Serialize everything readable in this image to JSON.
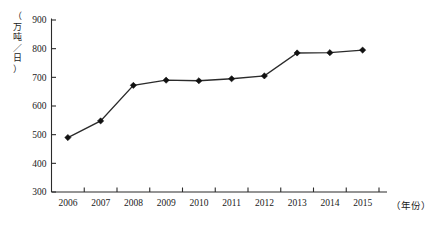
{
  "chart_data": {
    "type": "line",
    "title": "",
    "subtitle": "",
    "xlabel": "（年份）",
    "ylabel": "（万吨／日）",
    "categories": [
      "2006",
      "2007",
      "2008",
      "2009",
      "2010",
      "2011",
      "2012",
      "2013",
      "2014",
      "2015"
    ],
    "values": [
      490,
      548,
      672,
      690,
      688,
      695,
      705,
      785,
      786,
      795
    ],
    "series": [
      {
        "name": "日均处理量",
        "values": [
          490,
          548,
          672,
          690,
          688,
          695,
          705,
          785,
          786,
          795
        ]
      }
    ],
    "ylim": [
      300,
      900
    ],
    "ytick_labels": [
      "900",
      "800",
      "700",
      "600",
      "500",
      "400",
      "300"
    ],
    "ytick_values": [
      900,
      800,
      700,
      600,
      500,
      400,
      300
    ],
    "xtick_labels": [
      "2006",
      "2007",
      "2008",
      "2009",
      "2010",
      "2011",
      "2012",
      "2013",
      "2014",
      "2015"
    ],
    "grid": false,
    "legend": false,
    "legend_position": "none",
    "marker": "diamond",
    "line_color": "#2b2b2b",
    "marker_color": "#111111",
    "axis_color": "#2b2b2b",
    "background_color": "#ffffff"
  },
  "axes": {
    "y_unit_label": "（万吨／日）",
    "y_unit_chars": "（\n万\n吨\n／\n日\n）",
    "x_unit_label": "（年份）"
  }
}
